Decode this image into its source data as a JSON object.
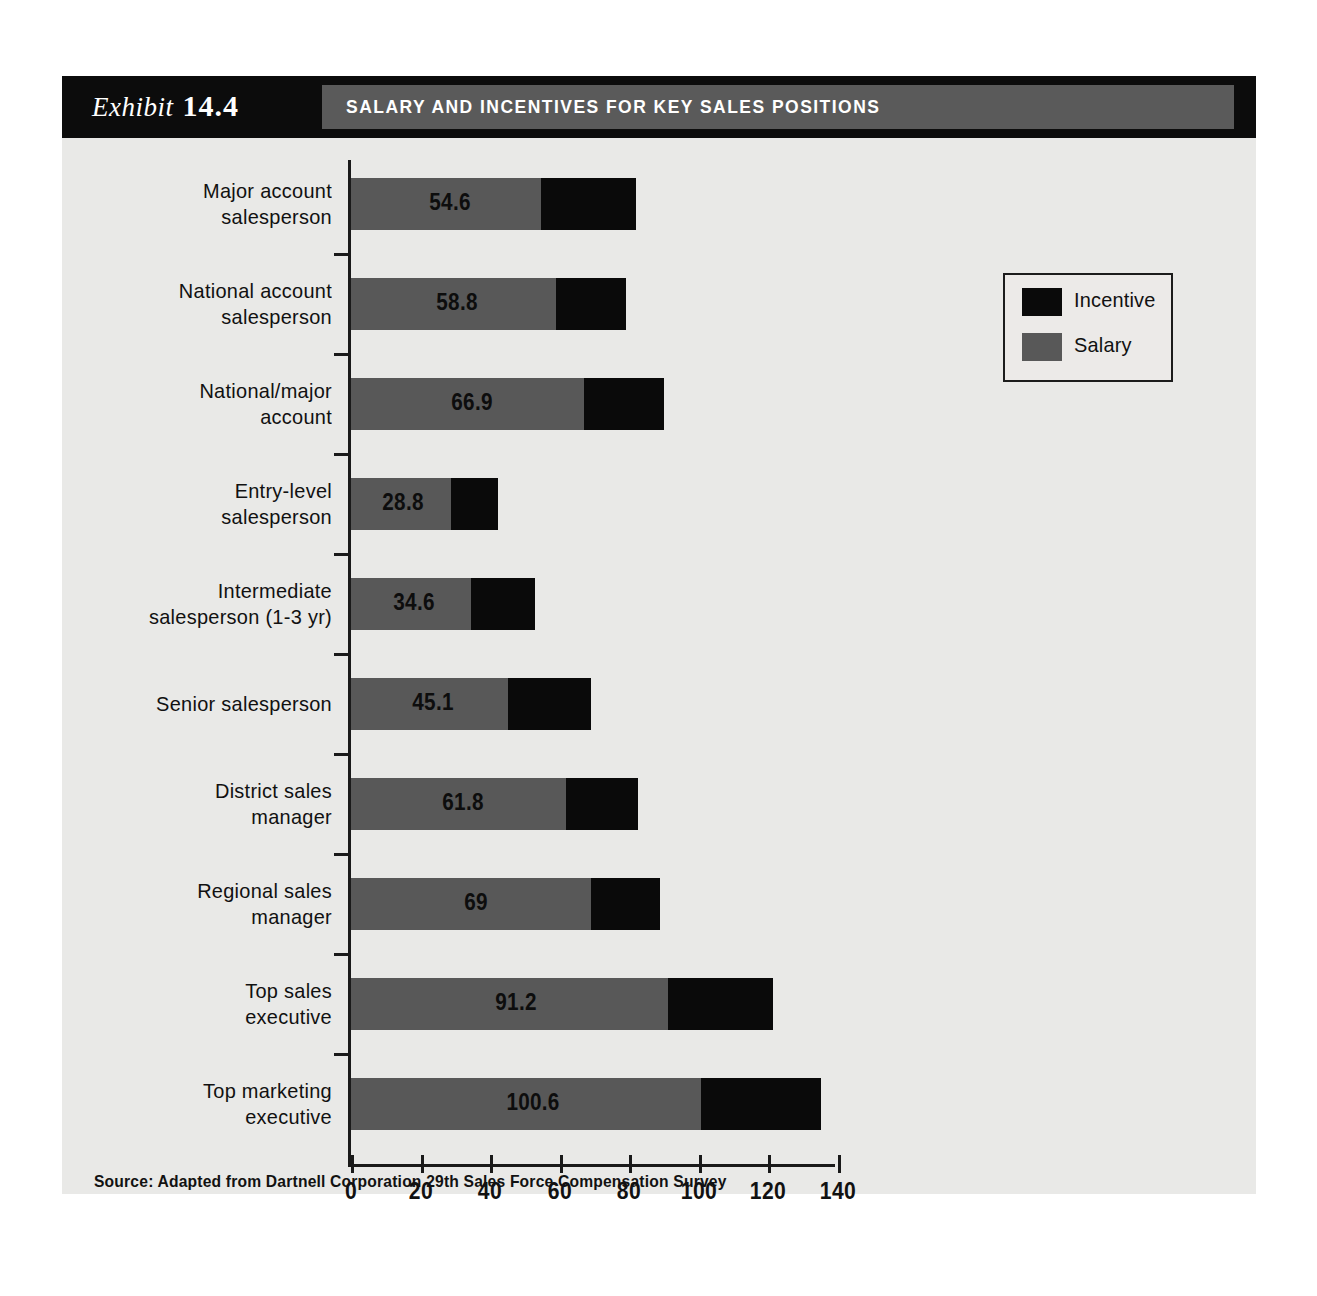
{
  "exhibit": {
    "word": "Exhibit",
    "number": "14.4",
    "title": "SALARY AND INCENTIVES FOR KEY SALES POSITIONS"
  },
  "legend": {
    "items": [
      {
        "label": "Incentive",
        "color": "#0a0a0a"
      },
      {
        "label": "Salary",
        "color": "#585858"
      }
    ]
  },
  "source": "Source: Adapted from Dartnell Corporation 29th Sales Force Compensation Survey",
  "chart_data": {
    "type": "bar",
    "orientation": "horizontal",
    "stacked": true,
    "title": "SALARY AND INCENTIVES FOR KEY SALES POSITIONS",
    "xlabel": "",
    "ylabel": "",
    "xlim": [
      0,
      140
    ],
    "xticks": [
      0,
      20,
      40,
      60,
      80,
      100,
      120,
      140
    ],
    "grid": false,
    "legend_position": "top-right",
    "categories": [
      "Major account salesperson",
      "National account salesperson",
      "National/major account",
      "Entry-level salesperson",
      "Intermediate salesperson (1-3 yr)",
      "Senior salesperson",
      "District sales manager",
      "Regional sales manager",
      "Top sales executive",
      "Top marketing executive"
    ],
    "category_lines": [
      [
        "Major account",
        "salesperson"
      ],
      [
        "National account",
        "salesperson"
      ],
      [
        "National/major",
        "account"
      ],
      [
        "Entry-level",
        "salesperson"
      ],
      [
        "Intermediate",
        "salesperson (1-3 yr)"
      ],
      [
        "Senior salesperson"
      ],
      [
        "District sales",
        "manager"
      ],
      [
        "Regional sales",
        "manager"
      ],
      [
        "Top sales",
        "executive"
      ],
      [
        "Top marketing",
        "executive"
      ]
    ],
    "series": [
      {
        "name": "Salary",
        "color": "#585858",
        "values": [
          54.6,
          58.8,
          66.9,
          28.8,
          34.6,
          45.1,
          61.8,
          69,
          91.2,
          100.6
        ]
      },
      {
        "name": "Incentive",
        "color": "#0a0a0a",
        "values": [
          27.4,
          20.2,
          23.1,
          13.5,
          18.2,
          23.9,
          20.8,
          19.8,
          30.2,
          34.4
        ]
      }
    ],
    "data_labels": [
      "54.6",
      "58.8",
      "66.9",
      "28.8",
      "34.6",
      "45.1",
      "61.8",
      "69",
      "91.2",
      "100.6"
    ],
    "totals": [
      82.0,
      79.0,
      90.0,
      42.3,
      52.8,
      69.0,
      82.6,
      88.8,
      121.4,
      135.0
    ]
  }
}
